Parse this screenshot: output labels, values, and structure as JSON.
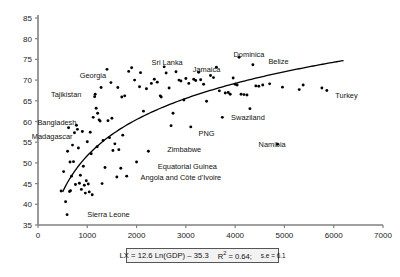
{
  "figure": {
    "background": "#ffffff",
    "point_color": "#000000",
    "axis_color": "#808080",
    "curve_color": "#000000"
  },
  "axes": {
    "x": {
      "label": "",
      "min": 0,
      "max": 7000,
      "ticks": [
        0,
        1000,
        2000,
        3000,
        4000,
        5000,
        6000,
        7000
      ],
      "tick_labels": [
        "0",
        "1000",
        "2000",
        "3000",
        "4000",
        "5000",
        "6000",
        "7000"
      ]
    },
    "y": {
      "label": "",
      "min": 35,
      "max": 85,
      "ticks": [
        35,
        40,
        45,
        50,
        55,
        60,
        65,
        70,
        75,
        80,
        85
      ],
      "tick_labels": [
        "35",
        "40",
        "45",
        "50",
        "55",
        "60",
        "65",
        "70",
        "75",
        "80",
        "85"
      ]
    }
  },
  "equation_box": {
    "equation": "LX = 12.6 Ln(GDP) – 35.3",
    "r_squared_prefix": "R",
    "r_squared_exp": "2",
    "r_squared_value": " = 0.64;",
    "se_text": "s.e = 6.1"
  },
  "chart_data": {
    "type": "scatter",
    "title": "",
    "xlabel": "",
    "ylabel": "",
    "xlim": [
      0,
      7000
    ],
    "ylim": [
      35,
      85
    ],
    "grid": false,
    "legend": "none",
    "fit_curve": {
      "form": "logarithmic",
      "equation": "LX = 12.6 Ln(GDP) - 35.3",
      "slope": 12.6,
      "intercept": -35.3,
      "r_squared": 0.64,
      "standard_error": 6.1,
      "x_start": 500,
      "x_end": 6200
    },
    "annotations": [
      {
        "text": "Georgia",
        "x": 1380,
        "y": 71.2,
        "anchor": "end"
      },
      {
        "text": "Sri Lanka",
        "x": 2620,
        "y": 74.3,
        "anchor": "middle"
      },
      {
        "text": "Jamaica",
        "x": 3420,
        "y": 72.6,
        "anchor": "middle"
      },
      {
        "text": "Dominica",
        "x": 4280,
        "y": 76.3,
        "anchor": "middle"
      },
      {
        "text": "Belize",
        "x": 4880,
        "y": 74.6,
        "anchor": "middle"
      },
      {
        "text": "Tajikistan",
        "x": 880,
        "y": 66.6,
        "anchor": "end"
      },
      {
        "text": "Turkey",
        "x": 6260,
        "y": 66.4,
        "anchor": "middle"
      },
      {
        "text": "Bangladesh",
        "x": 780,
        "y": 59.8,
        "anchor": "end"
      },
      {
        "text": "Madagascar",
        "x": 700,
        "y": 56.4,
        "anchor": "end"
      },
      {
        "text": "Swaziland",
        "x": 4260,
        "y": 61.0,
        "anchor": "middle"
      },
      {
        "text": "PNG",
        "x": 3420,
        "y": 57.2,
        "anchor": "middle"
      },
      {
        "text": "Zimbabwe",
        "x": 2620,
        "y": 53.3,
        "anchor": "start"
      },
      {
        "text": "Namibia",
        "x": 4750,
        "y": 54.5,
        "anchor": "middle"
      },
      {
        "text": "Equatorial Guinea",
        "x": 2430,
        "y": 49.1,
        "anchor": "start"
      },
      {
        "text": "Angola and Côte d'Ivoire",
        "x": 2080,
        "y": 46.4,
        "anchor": "start"
      },
      {
        "text": "Sierra Leone",
        "x": 1000,
        "y": 37.6,
        "anchor": "start"
      }
    ],
    "points": [
      {
        "x": 470,
        "y": 43.2
      },
      {
        "x": 520,
        "y": 47.9
      },
      {
        "x": 560,
        "y": 40.6
      },
      {
        "x": 590,
        "y": 37.5
      },
      {
        "x": 600,
        "y": 52.8
      },
      {
        "x": 620,
        "y": 58.5
      },
      {
        "x": 640,
        "y": 43.1
      },
      {
        "x": 650,
        "y": 50.2
      },
      {
        "x": 660,
        "y": 43.3
      },
      {
        "x": 680,
        "y": 46.8
      },
      {
        "x": 700,
        "y": 54.3
      },
      {
        "x": 720,
        "y": 50.3
      },
      {
        "x": 740,
        "y": 57.3
      },
      {
        "x": 760,
        "y": 44.8
      },
      {
        "x": 780,
        "y": 59.1
      },
      {
        "x": 800,
        "y": 58.1
      },
      {
        "x": 820,
        "y": 53.6
      },
      {
        "x": 840,
        "y": 45.1
      },
      {
        "x": 860,
        "y": 47.0
      },
      {
        "x": 880,
        "y": 43.6
      },
      {
        "x": 900,
        "y": 57.6
      },
      {
        "x": 920,
        "y": 49.2
      },
      {
        "x": 940,
        "y": 44.6
      },
      {
        "x": 960,
        "y": 42.7
      },
      {
        "x": 980,
        "y": 45.7
      },
      {
        "x": 1000,
        "y": 55.1
      },
      {
        "x": 1020,
        "y": 44.9
      },
      {
        "x": 1040,
        "y": 43.0
      },
      {
        "x": 1060,
        "y": 57.4
      },
      {
        "x": 1080,
        "y": 52.2
      },
      {
        "x": 1100,
        "y": 42.3
      },
      {
        "x": 1120,
        "y": 61.0
      },
      {
        "x": 1150,
        "y": 66.0
      },
      {
        "x": 1160,
        "y": 66.6
      },
      {
        "x": 1180,
        "y": 63.2
      },
      {
        "x": 1200,
        "y": 53.9
      },
      {
        "x": 1210,
        "y": 62.0
      },
      {
        "x": 1240,
        "y": 60.4
      },
      {
        "x": 1260,
        "y": 60.1
      },
      {
        "x": 1280,
        "y": 68.2
      },
      {
        "x": 1300,
        "y": 45.0
      },
      {
        "x": 1320,
        "y": 55.4
      },
      {
        "x": 1360,
        "y": 48.9
      },
      {
        "x": 1400,
        "y": 72.6
      },
      {
        "x": 1420,
        "y": 60.2
      },
      {
        "x": 1450,
        "y": 56.1
      },
      {
        "x": 1480,
        "y": 69.4
      },
      {
        "x": 1500,
        "y": 60.8
      },
      {
        "x": 1520,
        "y": 53.0
      },
      {
        "x": 1560,
        "y": 54.6
      },
      {
        "x": 1600,
        "y": 46.6
      },
      {
        "x": 1620,
        "y": 68.2
      },
      {
        "x": 1640,
        "y": 53.2
      },
      {
        "x": 1680,
        "y": 48.7
      },
      {
        "x": 1700,
        "y": 65.9
      },
      {
        "x": 1720,
        "y": 56.7
      },
      {
        "x": 1760,
        "y": 66.2
      },
      {
        "x": 1800,
        "y": 46.8
      },
      {
        "x": 1840,
        "y": 72.1
      },
      {
        "x": 1900,
        "y": 73.0
      },
      {
        "x": 1960,
        "y": 70.0
      },
      {
        "x": 2000,
        "y": 50.2
      },
      {
        "x": 2060,
        "y": 68.4
      },
      {
        "x": 2080,
        "y": 71.8
      },
      {
        "x": 2140,
        "y": 62.5
      },
      {
        "x": 2200,
        "y": 67.9
      },
      {
        "x": 2240,
        "y": 52.8
      },
      {
        "x": 2300,
        "y": 69.2
      },
      {
        "x": 2360,
        "y": 70.2
      },
      {
        "x": 2420,
        "y": 69.5
      },
      {
        "x": 2480,
        "y": 66.2
      },
      {
        "x": 2500,
        "y": 65.9
      },
      {
        "x": 2560,
        "y": 73.2
      },
      {
        "x": 2600,
        "y": 71.7
      },
      {
        "x": 2660,
        "y": 68.1
      },
      {
        "x": 2700,
        "y": 59.0
      },
      {
        "x": 2740,
        "y": 62.0
      },
      {
        "x": 2800,
        "y": 72.0
      },
      {
        "x": 2860,
        "y": 70.0
      },
      {
        "x": 2900,
        "y": 69.8
      },
      {
        "x": 2960,
        "y": 65.2
      },
      {
        "x": 3000,
        "y": 70.4
      },
      {
        "x": 3060,
        "y": 69.2
      },
      {
        "x": 3100,
        "y": 58.7
      },
      {
        "x": 3160,
        "y": 70.2
      },
      {
        "x": 3200,
        "y": 69.9
      },
      {
        "x": 3260,
        "y": 71.9
      },
      {
        "x": 3300,
        "y": 70.1
      },
      {
        "x": 3360,
        "y": 69.0
      },
      {
        "x": 3420,
        "y": 64.9
      },
      {
        "x": 3500,
        "y": 71.1
      },
      {
        "x": 3560,
        "y": 70.6
      },
      {
        "x": 3620,
        "y": 73.1
      },
      {
        "x": 3680,
        "y": 67.4
      },
      {
        "x": 3740,
        "y": 61.0
      },
      {
        "x": 3800,
        "y": 66.9
      },
      {
        "x": 3860,
        "y": 67.0
      },
      {
        "x": 3900,
        "y": 66.6
      },
      {
        "x": 3960,
        "y": 70.5
      },
      {
        "x": 4000,
        "y": 69.0
      },
      {
        "x": 4040,
        "y": 68.8
      },
      {
        "x": 4080,
        "y": 75.5
      },
      {
        "x": 4120,
        "y": 66.6
      },
      {
        "x": 4180,
        "y": 66.5
      },
      {
        "x": 4240,
        "y": 66.4
      },
      {
        "x": 4300,
        "y": 63.1
      },
      {
        "x": 4360,
        "y": 73.7
      },
      {
        "x": 4420,
        "y": 68.6
      },
      {
        "x": 4480,
        "y": 68.5
      },
      {
        "x": 4560,
        "y": 68.8
      },
      {
        "x": 4700,
        "y": 69.1
      },
      {
        "x": 4860,
        "y": 54.5
      },
      {
        "x": 4960,
        "y": 68.3
      },
      {
        "x": 5300,
        "y": 67.7
      },
      {
        "x": 5380,
        "y": 68.8
      },
      {
        "x": 5760,
        "y": 68.1
      },
      {
        "x": 5860,
        "y": 67.5
      }
    ]
  }
}
